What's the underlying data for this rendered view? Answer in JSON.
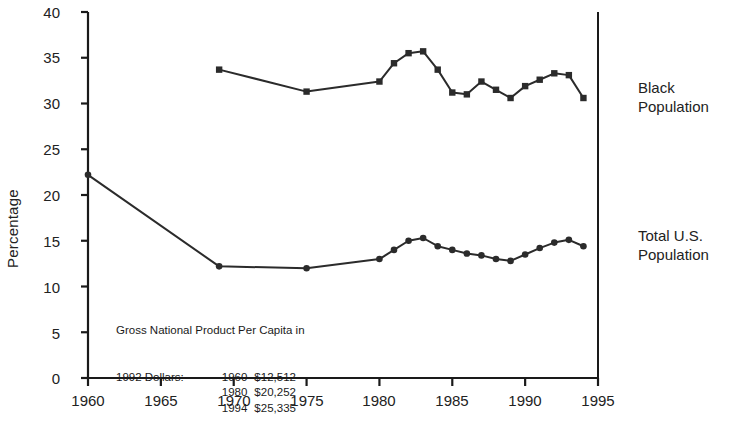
{
  "chart_data": {
    "type": "line",
    "title": "",
    "subtitle": "",
    "xlabel": "",
    "ylabel": "Percentage",
    "xlim": [
      1960,
      1995
    ],
    "ylim": [
      0,
      40
    ],
    "xticks": [
      1960,
      1965,
      1970,
      1975,
      1980,
      1985,
      1990,
      1995
    ],
    "yticks": [
      0,
      5,
      10,
      15,
      20,
      25,
      30,
      35,
      40
    ],
    "grid": false,
    "legend_position": "right-inline",
    "series": [
      {
        "name": "Black Population",
        "marker": "square",
        "color": "#2b2b2b",
        "x": [
          1969,
          1975,
          1980,
          1981,
          1982,
          1983,
          1984,
          1985,
          1986,
          1987,
          1988,
          1989,
          1990,
          1991,
          1992,
          1993,
          1994
        ],
        "values": [
          33.7,
          31.3,
          32.4,
          34.4,
          35.5,
          35.7,
          33.7,
          31.2,
          31.0,
          32.4,
          31.5,
          30.6,
          31.9,
          32.6,
          33.3,
          33.1,
          30.6
        ]
      },
      {
        "name": "Total U.S. Population",
        "marker": "circle",
        "color": "#2b2b2b",
        "x": [
          1960,
          1969,
          1975,
          1980,
          1981,
          1982,
          1983,
          1984,
          1985,
          1986,
          1987,
          1988,
          1989,
          1990,
          1991,
          1992,
          1993,
          1994
        ],
        "values": [
          22.2,
          12.2,
          12.0,
          13.0,
          14.0,
          15.0,
          15.3,
          14.4,
          14.0,
          13.6,
          13.4,
          13.0,
          12.8,
          13.5,
          14.2,
          14.8,
          15.1,
          14.4
        ]
      }
    ],
    "annotation": {
      "line1": "Gross National Product Per Capita in",
      "line2": "1992 Dollars:",
      "rows": [
        {
          "year": "1960",
          "value": "$12,512"
        },
        {
          "year": "1980",
          "value": "$20,252"
        },
        {
          "year": "1994",
          "value": "$25,335"
        }
      ]
    },
    "series_labels": [
      {
        "line1": "Black",
        "line2": "Population"
      },
      {
        "line1": "Total U.S.",
        "line2": "Population"
      }
    ]
  }
}
